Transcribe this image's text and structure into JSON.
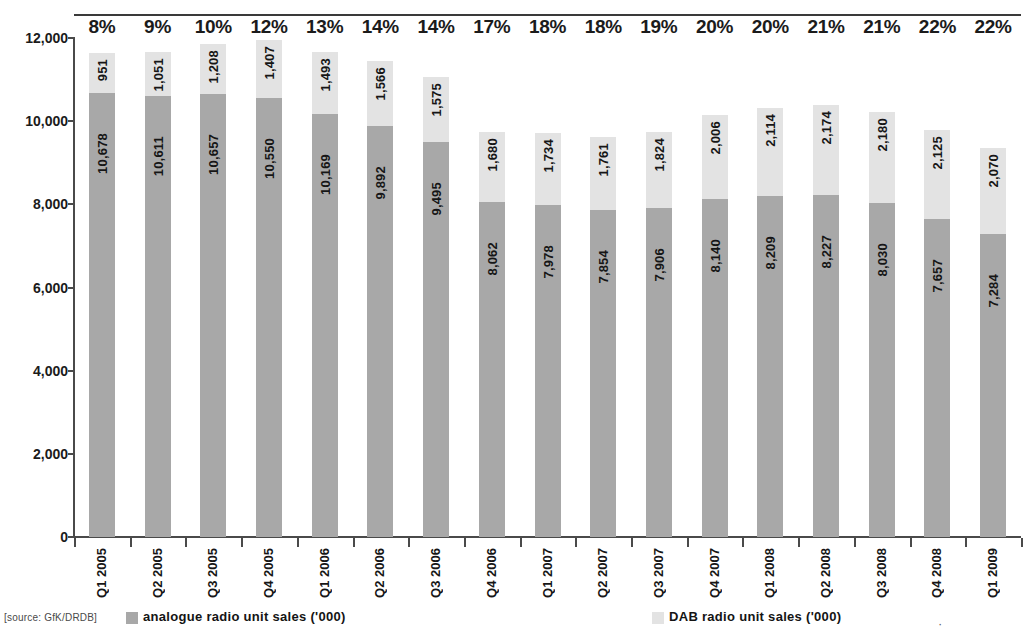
{
  "source_note": "[source: GfK/DRDB]",
  "legend": {
    "analogue": {
      "label": "analogue radio unit sales ('000)",
      "color": "#a8a8a8"
    },
    "dab": {
      "label": "DAB radio unit sales ('000)",
      "color": "#e3e3e3"
    },
    "extra_marker": "·"
  },
  "chart_data": {
    "type": "bar",
    "subtype": "stacked-bar",
    "title": "",
    "xlabel": "",
    "ylabel": "",
    "ylim": [
      0,
      12000
    ],
    "ytick_labels": [
      "0",
      "2,000",
      "4,000",
      "6,000",
      "8,000",
      "10,000",
      "12,000"
    ],
    "ytick_values": [
      0,
      2000,
      4000,
      6000,
      8000,
      10000,
      12000
    ],
    "grid": false,
    "legend_position": "bottom",
    "categories": [
      "Q1 2005",
      "Q2 2005",
      "Q3 2005",
      "Q4 2005",
      "Q1 2006",
      "Q2 2006",
      "Q3 2006",
      "Q4 2006",
      "Q1 2007",
      "Q2 2007",
      "Q3 2007",
      "Q4 2007",
      "Q1 2008",
      "Q2 2008",
      "Q3 2008",
      "Q4 2008",
      "Q1 2009"
    ],
    "series": [
      {
        "name": "analogue radio unit sales ('000)",
        "color": "#a8a8a8",
        "values": [
          10678,
          10611,
          10657,
          10550,
          10169,
          9892,
          9495,
          8062,
          7978,
          7854,
          7906,
          8140,
          8209,
          8227,
          8030,
          7657,
          7284
        ],
        "labels": [
          "10,678",
          "10,611",
          "10,657",
          "10,550",
          "10,169",
          "9,892",
          "9,495",
          "8,062",
          "7,978",
          "7,854",
          "7,906",
          "8,140",
          "8,209",
          "8,227",
          "8,030",
          "7,657",
          "7,284"
        ]
      },
      {
        "name": "DAB radio unit sales ('000)",
        "color": "#e3e3e3",
        "values": [
          951,
          1051,
          1208,
          1407,
          1493,
          1566,
          1575,
          1680,
          1734,
          1761,
          1824,
          2006,
          2114,
          2174,
          2180,
          2125,
          2070
        ],
        "labels": [
          "951",
          "1,051",
          "1,208",
          "1,407",
          "1,493",
          "1,566",
          "1,575",
          "1,680",
          "1,734",
          "1,761",
          "1,824",
          "2,006",
          "2,114",
          "2,174",
          "2,180",
          "2,125",
          "2,070"
        ]
      }
    ],
    "annotations": {
      "name": "DAB share of total",
      "position": "above-bars",
      "values": [
        "8%",
        "9%",
        "10%",
        "12%",
        "13%",
        "14%",
        "14%",
        "17%",
        "18%",
        "18%",
        "19%",
        "20%",
        "20%",
        "21%",
        "21%",
        "22%",
        "22%"
      ]
    }
  }
}
